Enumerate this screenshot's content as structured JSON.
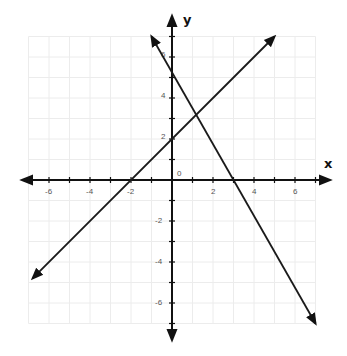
{
  "chart_data": {
    "type": "line",
    "title": "",
    "xlabel": "x",
    "ylabel": "y",
    "xlim": [
      -7,
      7
    ],
    "ylim": [
      -7,
      7
    ],
    "grid": true,
    "origin_label": "0",
    "x_tick_labels": [
      "-6",
      "-4",
      "-2",
      "2",
      "4",
      "6"
    ],
    "x_ticks": [
      -6,
      -4,
      -2,
      2,
      4,
      6
    ],
    "y_tick_labels": [
      "-6",
      "-4",
      "-2",
      "2",
      "4",
      "6"
    ],
    "y_ticks": [
      -6,
      -4,
      -2,
      2,
      4,
      6
    ],
    "series": [
      {
        "name": "line-increasing",
        "equation": "y = x + 2",
        "x": [
          -6.8,
          5.0
        ],
        "y": [
          -4.8,
          7.0
        ],
        "x_intercept": -2,
        "y_intercept": 2
      },
      {
        "name": "line-decreasing",
        "equation": "y = -1.75x + 5.25",
        "x": [
          -1.0,
          7.0
        ],
        "y": [
          7.0,
          -7.0
        ],
        "x_intercept": 3,
        "y_intercept": 5.25
      }
    ],
    "intersection": {
      "x": 1.18,
      "y": 3.18
    },
    "legend": []
  },
  "labels": {
    "x_axis": "x",
    "y_axis": "y",
    "origin": "0",
    "xt": [
      "-6",
      "-4",
      "-2",
      "2",
      "4",
      "6"
    ],
    "yt": [
      "6",
      "4",
      "2",
      "-2",
      "-4",
      "-6"
    ]
  },
  "colors": {
    "grid": "#ececec",
    "axis": "#111111",
    "line": "#1a1a1a"
  }
}
